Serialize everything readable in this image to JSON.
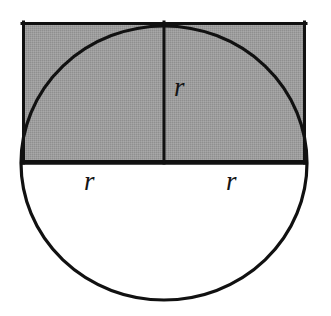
{
  "figure": {
    "background_color": "#ffffff",
    "stroke_color": "#111111",
    "shade_color": "#9a9a9a",
    "stroke_width": 3,
    "canvas": {
      "width": 331,
      "height": 316
    },
    "circle": {
      "name": "circle",
      "center_x": 164,
      "center_y": 163,
      "radius_x": 143,
      "radius_y": 137,
      "fill": "none"
    },
    "rectangle": {
      "name": "shaded-rectangle",
      "x": 22,
      "y": 22,
      "width": 284,
      "height": 141,
      "fill": "#9a9a9a"
    },
    "vertical_radius": {
      "name": "vertical-radius-line",
      "x": 164,
      "y_top": 22,
      "y_bottom": 163
    },
    "labels": [
      {
        "id": "r-vertical",
        "text": "r",
        "x": 174,
        "y": 74,
        "role": "vertical radius label"
      },
      {
        "id": "r-bottom-left",
        "text": "r",
        "x": 84,
        "y": 168,
        "role": "left horizontal radius label"
      },
      {
        "id": "r-bottom-right",
        "text": "r",
        "x": 226,
        "y": 168,
        "role": "right horizontal radius label"
      }
    ]
  }
}
